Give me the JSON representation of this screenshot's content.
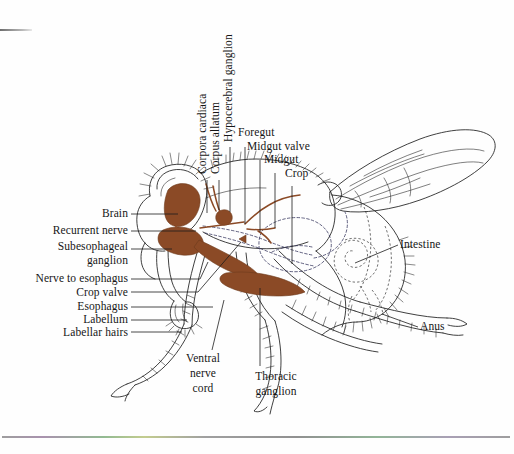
{
  "figure": {
    "kind": "anatomical-illustration",
    "ink_color": "#1a1a1a",
    "organ_fill_color": "#8B4A26",
    "background_color": "#ffffff"
  },
  "labels": {
    "vertical": [
      {
        "id": "corpora-cardiaca",
        "text": "Corpora cardiaca"
      },
      {
        "id": "corpus-allatum",
        "text": "Corpus allatum"
      },
      {
        "id": "hypocerebral-ganglion",
        "text": "Hypocerebral ganglion"
      }
    ],
    "top_right_stack": [
      {
        "id": "foregut",
        "text": "Foregut"
      },
      {
        "id": "midgut-valve",
        "text": "Midgut valve"
      },
      {
        "id": "midgut",
        "text": "Midgut"
      },
      {
        "id": "crop",
        "text": "Crop"
      }
    ],
    "left_stack": [
      {
        "id": "brain",
        "text": "Brain"
      },
      {
        "id": "recurrent-nerve",
        "text": "Recurrent nerve"
      },
      {
        "id": "subesophageal-line1",
        "text": "Subesophageal"
      },
      {
        "id": "subesophageal-line2",
        "text": "ganglion"
      },
      {
        "id": "nerve-to-esophagus",
        "text": "Nerve to esophagus"
      },
      {
        "id": "crop-valve",
        "text": "Crop valve"
      },
      {
        "id": "esophagus",
        "text": "Esophagus"
      },
      {
        "id": "labellum",
        "text": "Labellum"
      },
      {
        "id": "labellar-hairs",
        "text": "Labellar hairs"
      }
    ],
    "right_stack": [
      {
        "id": "intestine",
        "text": "Intestine"
      },
      {
        "id": "anus",
        "text": "Anus"
      }
    ],
    "bottom_stack": [
      {
        "id": "ventral-nerve-cord",
        "text": "Ventral\nnerve\ncord"
      },
      {
        "id": "thoracic-ganglion",
        "text": "Thoracic\nganglion"
      }
    ]
  },
  "bottom_labels_flat": {
    "ventral_l1": "Ventral",
    "ventral_l2": "nerve",
    "ventral_l3": "cord",
    "thoracic_l1": "Thoracic",
    "thoracic_l2": "ganglion"
  }
}
